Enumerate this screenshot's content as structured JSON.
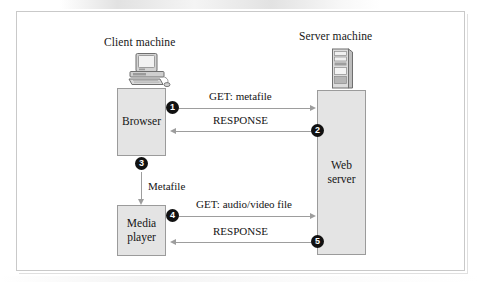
{
  "figure": {
    "client": {
      "title": "Client machine",
      "icon": "desktop-computer-icon",
      "boxes": [
        {
          "id": "browser",
          "label": "Browser"
        },
        {
          "id": "media-player",
          "label": "Media\nplayer"
        }
      ]
    },
    "server": {
      "title": "Server machine",
      "icon": "server-tower-icon",
      "boxes": [
        {
          "id": "web-server",
          "label": "Web\nserver"
        }
      ]
    },
    "internal_flow": {
      "label": "Metafile",
      "direction": "down",
      "from": "browser",
      "to": "media-player"
    },
    "messages": [
      {
        "step": "1",
        "label": "GET: metafile",
        "direction": "right",
        "from": "browser",
        "to": "web-server"
      },
      {
        "step": "2",
        "label": "RESPONSE",
        "direction": "left",
        "from": "web-server",
        "to": "browser"
      },
      {
        "step": "3",
        "label": "",
        "direction": "down",
        "from": "browser",
        "to": "media-player"
      },
      {
        "step": "4",
        "label": "GET: audio/video file",
        "direction": "right",
        "from": "media-player",
        "to": "web-server"
      },
      {
        "step": "5",
        "label": "RESPONSE",
        "direction": "left",
        "from": "web-server",
        "to": "media-player"
      }
    ]
  },
  "colors": {
    "box_fill": "#e4e4e4",
    "box_border": "#9b9b9b",
    "arrow": "#9d9d9d",
    "marker_fill": "#111111",
    "marker_text": "#ffffff",
    "frame_border": "#c9c9c9"
  }
}
